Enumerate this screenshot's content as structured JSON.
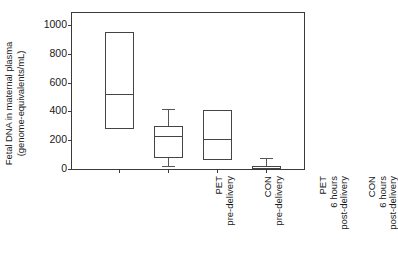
{
  "chart_data": {
    "type": "box",
    "title": "",
    "xlabel": "",
    "ylabel": "Fetal DNA in maternal plasma (genome-equivalents/mL)",
    "ylabel_line1": "Fetal DNA in maternal plasma",
    "ylabel_line2": "(genome-equivalents/mL)",
    "ylim": [
      0,
      1060
    ],
    "yticks": [
      0,
      200,
      400,
      600,
      800,
      1000
    ],
    "ytick_labels": [
      "0",
      "200",
      "400",
      "600",
      "800",
      "1000"
    ],
    "grid": false,
    "legend": "none",
    "categories": [
      "PET pre-delivery",
      "CON pre-delivery",
      "PET 6 hours post-delivery",
      "CON 6 hours post-delivery"
    ],
    "category_lines": [
      [
        "PET",
        "pre-delivery"
      ],
      [
        "CON",
        "pre-delivery"
      ],
      [
        "PET",
        "6 hours",
        "post-delivery"
      ],
      [
        "CON",
        "6 hours",
        "post-delivery"
      ]
    ],
    "boxes": [
      {
        "name": "PET pre-delivery",
        "whisker_low": null,
        "q1": 280,
        "median": 520,
        "q3": 950,
        "whisker_high": null
      },
      {
        "name": "CON pre-delivery",
        "whisker_low": 20,
        "q1": 75,
        "median": 230,
        "q3": 300,
        "whisker_high": 420
      },
      {
        "name": "PET 6 hours post-delivery",
        "whisker_low": null,
        "q1": 60,
        "median": 205,
        "q3": 410,
        "whisker_high": null
      },
      {
        "name": "CON 6 hours post-delivery",
        "whisker_low": 0,
        "q1": 0,
        "median": 8,
        "q3": 18,
        "whisker_high": 75
      }
    ],
    "colors": {
      "line": "#444444",
      "axis": "#3a3a3a",
      "background": "#ffffff",
      "text": "#1a1a1a"
    }
  }
}
